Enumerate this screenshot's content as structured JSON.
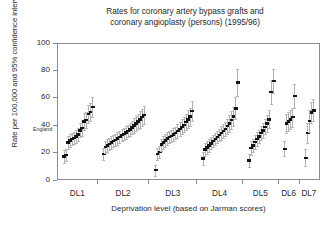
{
  "title": {
    "line1": "Rates for coronary artery bypass grafts and",
    "line2": "coronary angioplasty (persons) (1995/96)"
  },
  "axes": {
    "y_label": "Rate per 100,000 and 95% confidence intervals",
    "x_label": "Deprivation level (based on Jarman scores)",
    "y_ticks": [
      "0",
      "20",
      "40",
      "60",
      "80",
      "100"
    ],
    "x_groups": [
      "DL1",
      "DL2",
      "DL3",
      "DL4",
      "DL5",
      "DL6",
      "DL7"
    ]
  },
  "annotations": {
    "england": "England"
  },
  "chart_data": {
    "type": "scatter",
    "title": "Rates for coronary artery bypass grafts and coronary angioplasty (persons) (1995/96)",
    "xlabel": "Deprivation level (based on Jarman scores)",
    "ylabel": "Rate per 100,000 and 95% confidence intervals",
    "ylim": [
      0,
      100
    ],
    "y_ticks": [
      0,
      20,
      40,
      60,
      80,
      100
    ],
    "grid": false,
    "legend": "none",
    "marker_style": "point with vertical 95% confidence interval bars",
    "reference_line": {
      "label": "England",
      "value": 37.5
    },
    "categories": [
      "DL1",
      "DL2",
      "DL3",
      "DL4",
      "DL5",
      "DL6",
      "DL7"
    ],
    "note": "Within each deprivation-level group, health authorities are ordered by ascending rate; each point carries a 95% confidence interval whisker.",
    "series": [
      {
        "name": "DL1",
        "points": [
          {
            "value": 18.0,
            "lo": 13.5,
            "hi": 22.5
          },
          {
            "value": 19.0,
            "lo": 14.5,
            "hi": 23.5
          },
          {
            "value": 28.0,
            "lo": 23.5,
            "hi": 32.5
          },
          {
            "value": 29.5,
            "lo": 25.0,
            "hi": 34.0
          },
          {
            "value": 30.5,
            "lo": 26.0,
            "hi": 35.0
          },
          {
            "value": 31.5,
            "lo": 27.0,
            "hi": 36.0
          },
          {
            "value": 32.5,
            "lo": 28.0,
            "hi": 37.0
          },
          {
            "value": 34.0,
            "lo": 29.0,
            "hi": 39.0
          },
          {
            "value": 37.0,
            "lo": 32.0,
            "hi": 42.0
          },
          {
            "value": 38.5,
            "lo": 33.0,
            "hi": 44.0
          },
          {
            "value": 43.5,
            "lo": 37.5,
            "hi": 49.5
          },
          {
            "value": 44.5,
            "lo": 38.5,
            "hi": 50.5
          },
          {
            "value": 49.0,
            "lo": 42.5,
            "hi": 55.5
          },
          {
            "value": 50.5,
            "lo": 44.0,
            "hi": 57.0
          },
          {
            "value": 54.0,
            "lo": 47.0,
            "hi": 61.0
          }
        ]
      },
      {
        "name": "DL2",
        "points": [
          {
            "value": 19.5,
            "lo": 15.0,
            "hi": 24.0
          },
          {
            "value": 25.0,
            "lo": 20.5,
            "hi": 29.5
          },
          {
            "value": 26.0,
            "lo": 21.5,
            "hi": 30.5
          },
          {
            "value": 27.0,
            "lo": 22.5,
            "hi": 31.5
          },
          {
            "value": 28.0,
            "lo": 23.5,
            "hi": 32.5
          },
          {
            "value": 29.0,
            "lo": 24.5,
            "hi": 33.5
          },
          {
            "value": 30.0,
            "lo": 25.5,
            "hi": 34.5
          },
          {
            "value": 31.0,
            "lo": 26.5,
            "hi": 35.5
          },
          {
            "value": 32.0,
            "lo": 27.5,
            "hi": 36.5
          },
          {
            "value": 33.5,
            "lo": 29.0,
            "hi": 38.0
          },
          {
            "value": 34.5,
            "lo": 30.0,
            "hi": 39.0
          },
          {
            "value": 35.5,
            "lo": 31.0,
            "hi": 40.0
          },
          {
            "value": 36.5,
            "lo": 32.0,
            "hi": 41.0
          },
          {
            "value": 37.5,
            "lo": 33.0,
            "hi": 42.0
          },
          {
            "value": 39.0,
            "lo": 34.0,
            "hi": 44.0
          },
          {
            "value": 40.5,
            "lo": 35.0,
            "hi": 46.0
          },
          {
            "value": 42.0,
            "lo": 36.5,
            "hi": 47.5
          },
          {
            "value": 43.5,
            "lo": 38.0,
            "hi": 49.0
          },
          {
            "value": 45.0,
            "lo": 39.0,
            "hi": 51.0
          },
          {
            "value": 46.5,
            "lo": 40.5,
            "hi": 52.5
          },
          {
            "value": 48.0,
            "lo": 41.5,
            "hi": 54.5
          }
        ]
      },
      {
        "name": "DL3",
        "points": [
          {
            "value": 8.0,
            "lo": 4.0,
            "hi": 12.0
          },
          {
            "value": 19.5,
            "lo": 15.0,
            "hi": 24.0
          },
          {
            "value": 21.0,
            "lo": 16.5,
            "hi": 25.5
          },
          {
            "value": 26.5,
            "lo": 22.0,
            "hi": 31.0
          },
          {
            "value": 28.0,
            "lo": 23.5,
            "hi": 32.5
          },
          {
            "value": 29.5,
            "lo": 25.0,
            "hi": 34.0
          },
          {
            "value": 31.0,
            "lo": 26.5,
            "hi": 35.5
          },
          {
            "value": 32.0,
            "lo": 27.5,
            "hi": 36.5
          },
          {
            "value": 33.0,
            "lo": 28.5,
            "hi": 37.5
          },
          {
            "value": 34.0,
            "lo": 29.5,
            "hi": 38.5
          },
          {
            "value": 35.0,
            "lo": 30.5,
            "hi": 39.5
          },
          {
            "value": 36.5,
            "lo": 31.5,
            "hi": 41.5
          },
          {
            "value": 38.0,
            "lo": 33.0,
            "hi": 43.0
          },
          {
            "value": 39.5,
            "lo": 34.0,
            "hi": 45.0
          },
          {
            "value": 41.0,
            "lo": 35.5,
            "hi": 46.5
          },
          {
            "value": 43.0,
            "lo": 37.0,
            "hi": 49.0
          },
          {
            "value": 45.0,
            "lo": 38.5,
            "hi": 51.5
          },
          {
            "value": 47.0,
            "lo": 40.5,
            "hi": 53.5
          },
          {
            "value": 51.0,
            "lo": 43.5,
            "hi": 58.5
          }
        ]
      },
      {
        "name": "DL4",
        "points": [
          {
            "value": 16.5,
            "lo": 12.0,
            "hi": 21.0
          },
          {
            "value": 23.0,
            "lo": 18.5,
            "hi": 27.5
          },
          {
            "value": 24.5,
            "lo": 20.0,
            "hi": 29.0
          },
          {
            "value": 26.0,
            "lo": 21.5,
            "hi": 30.5
          },
          {
            "value": 27.5,
            "lo": 23.0,
            "hi": 32.0
          },
          {
            "value": 29.0,
            "lo": 24.5,
            "hi": 33.5
          },
          {
            "value": 30.5,
            "lo": 26.0,
            "hi": 35.0
          },
          {
            "value": 32.0,
            "lo": 27.5,
            "hi": 36.5
          },
          {
            "value": 33.5,
            "lo": 29.0,
            "hi": 38.0
          },
          {
            "value": 35.0,
            "lo": 30.0,
            "hi": 40.0
          },
          {
            "value": 36.5,
            "lo": 31.5,
            "hi": 41.5
          },
          {
            "value": 38.0,
            "lo": 33.0,
            "hi": 43.0
          },
          {
            "value": 40.0,
            "lo": 34.5,
            "hi": 45.5
          },
          {
            "value": 42.0,
            "lo": 36.0,
            "hi": 48.0
          },
          {
            "value": 44.5,
            "lo": 38.0,
            "hi": 51.0
          },
          {
            "value": 47.0,
            "lo": 40.0,
            "hi": 54.0
          },
          {
            "value": 53.0,
            "lo": 45.0,
            "hi": 61.0
          },
          {
            "value": 72.0,
            "lo": 62.0,
            "hi": 82.0
          }
        ]
      },
      {
        "name": "DL5",
        "points": [
          {
            "value": 15.0,
            "lo": 10.0,
            "hi": 20.0
          },
          {
            "value": 24.0,
            "lo": 19.0,
            "hi": 29.0
          },
          {
            "value": 26.0,
            "lo": 21.0,
            "hi": 31.0
          },
          {
            "value": 28.5,
            "lo": 23.5,
            "hi": 33.5
          },
          {
            "value": 30.5,
            "lo": 25.5,
            "hi": 35.5
          },
          {
            "value": 32.5,
            "lo": 27.5,
            "hi": 37.5
          },
          {
            "value": 35.0,
            "lo": 30.0,
            "hi": 40.0
          },
          {
            "value": 37.0,
            "lo": 31.5,
            "hi": 42.5
          },
          {
            "value": 39.5,
            "lo": 34.0,
            "hi": 45.0
          },
          {
            "value": 42.0,
            "lo": 36.0,
            "hi": 48.0
          },
          {
            "value": 45.0,
            "lo": 38.5,
            "hi": 51.5
          },
          {
            "value": 65.0,
            "lo": 56.0,
            "hi": 74.0
          },
          {
            "value": 73.0,
            "lo": 64.0,
            "hi": 82.0
          }
        ]
      },
      {
        "name": "DL6",
        "points": [
          {
            "value": 23.5,
            "lo": 18.0,
            "hi": 29.0
          },
          {
            "value": 42.0,
            "lo": 35.0,
            "hi": 49.0
          },
          {
            "value": 43.5,
            "lo": 36.5,
            "hi": 50.5
          },
          {
            "value": 45.0,
            "lo": 38.0,
            "hi": 52.0
          },
          {
            "value": 46.5,
            "lo": 39.5,
            "hi": 53.5
          },
          {
            "value": 62.0,
            "lo": 53.0,
            "hi": 71.0
          }
        ]
      },
      {
        "name": "DL7",
        "points": [
          {
            "value": 17.0,
            "lo": 11.0,
            "hi": 23.0
          },
          {
            "value": 35.0,
            "lo": 28.0,
            "hi": 42.0
          },
          {
            "value": 44.0,
            "lo": 36.0,
            "hi": 52.0
          },
          {
            "value": 50.0,
            "lo": 42.0,
            "hi": 58.0
          },
          {
            "value": 51.5,
            "lo": 43.5,
            "hi": 59.5
          }
        ]
      }
    ]
  }
}
